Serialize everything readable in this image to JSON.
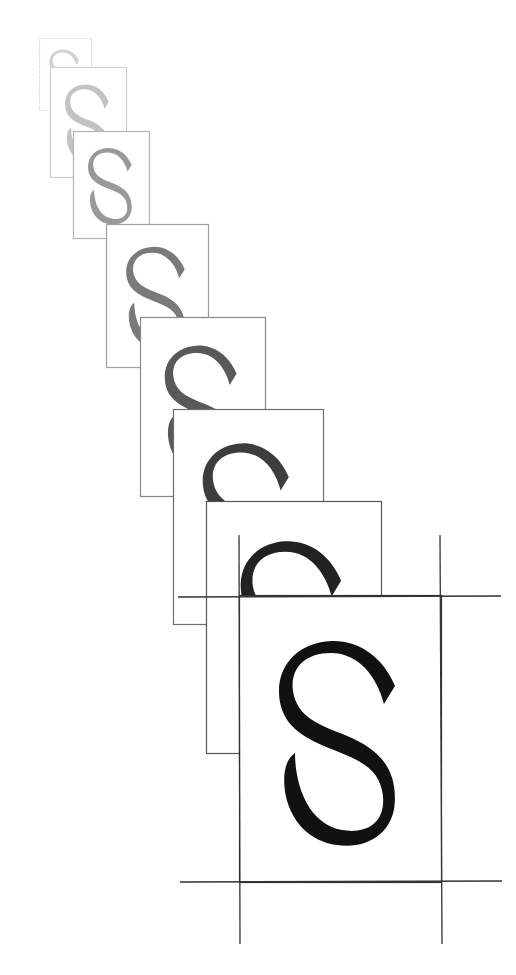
{
  "figure": {
    "glyph": "S",
    "canvas": {
      "width": 516,
      "height": 975
    },
    "frames": [
      {
        "index": 1,
        "left": 39,
        "top": 38,
        "right": 91,
        "bottom": 110,
        "stroke": "#d6d6d6",
        "fill": "#d2d2d2",
        "dashed": true
      },
      {
        "index": 2,
        "left": 50,
        "top": 67,
        "right": 126,
        "bottom": 177,
        "stroke": "#cfcfcf",
        "fill": "#c2c2c2",
        "dashed": false
      },
      {
        "index": 3,
        "left": 73,
        "top": 131,
        "right": 149,
        "bottom": 238,
        "stroke": "#b3b3b3",
        "fill": "#999999",
        "dashed": false
      },
      {
        "index": 4,
        "left": 106,
        "top": 224,
        "right": 208,
        "bottom": 367,
        "stroke": "#9e9e9e",
        "fill": "#7a7a7a",
        "dashed": false
      },
      {
        "index": 5,
        "left": 140,
        "top": 317,
        "right": 265,
        "bottom": 496,
        "stroke": "#888888",
        "fill": "#595959",
        "dashed": false
      },
      {
        "index": 6,
        "left": 173,
        "top": 409,
        "right": 323,
        "bottom": 624,
        "stroke": "#6e6e6e",
        "fill": "#3d3d3d",
        "dashed": false
      },
      {
        "index": 7,
        "left": 206,
        "top": 501,
        "right": 381,
        "bottom": 753,
        "stroke": "#555555",
        "fill": "#222222",
        "dashed": false
      },
      {
        "index": 8,
        "left": 239,
        "top": 595,
        "right": 441,
        "bottom": 882,
        "stroke": "#333333",
        "fill": "#111111",
        "dashed": false
      }
    ],
    "crop_marks": {
      "color": "#333333",
      "lines": [
        {
          "x1": 239,
          "y1": 535,
          "x2": 240,
          "y2": 944
        },
        {
          "x1": 440,
          "y1": 535,
          "x2": 442,
          "y2": 944
        },
        {
          "x1": 178,
          "y1": 597,
          "x2": 501,
          "y2": 596
        },
        {
          "x1": 180,
          "y1": 882,
          "x2": 502,
          "y2": 881
        }
      ]
    }
  }
}
